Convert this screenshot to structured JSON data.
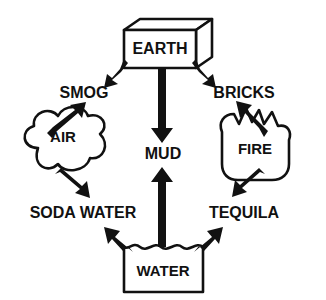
{
  "diagram": {
    "background_color": "#ffffff",
    "line_color": "#111111",
    "nodes": {
      "earth": {
        "label": "EARTH",
        "shape": "3d-box",
        "x": 160,
        "y": 49
      },
      "air": {
        "label": "AIR",
        "shape": "cloud",
        "x": 63,
        "y": 156
      },
      "fire": {
        "label": "FIRE",
        "shape": "flame",
        "x": 253,
        "y": 150
      },
      "water": {
        "label": "WATER",
        "shape": "wavy-box",
        "x": 163,
        "y": 272
      },
      "smog": {
        "label": "SMOG",
        "shape": "text",
        "x": 84,
        "y": 94
      },
      "bricks": {
        "label": "BRICKS",
        "shape": "text",
        "x": 244,
        "y": 94
      },
      "mud": {
        "label": "MUD",
        "shape": "text",
        "x": 163,
        "y": 155
      },
      "soda_water": {
        "label": "SODA WATER",
        "shape": "text",
        "x": 83,
        "y": 214
      },
      "tequila": {
        "label": "TEQUILA",
        "shape": "text",
        "x": 244,
        "y": 214
      }
    },
    "edges": [
      {
        "from": "earth",
        "to": "smog",
        "direction": "down-left"
      },
      {
        "from": "earth",
        "to": "mud",
        "direction": "down"
      },
      {
        "from": "earth",
        "to": "bricks",
        "direction": "down-right"
      },
      {
        "from": "air",
        "to": "smog",
        "direction": "up-right"
      },
      {
        "from": "air",
        "to": "soda_water",
        "direction": "down-right"
      },
      {
        "from": "fire",
        "to": "bricks",
        "direction": "up-left"
      },
      {
        "from": "fire",
        "to": "tequila",
        "direction": "down-left"
      },
      {
        "from": "water",
        "to": "mud",
        "direction": "up"
      },
      {
        "from": "water",
        "to": "soda_water",
        "direction": "up-left"
      },
      {
        "from": "water",
        "to": "tequila",
        "direction": "up-right"
      }
    ]
  }
}
